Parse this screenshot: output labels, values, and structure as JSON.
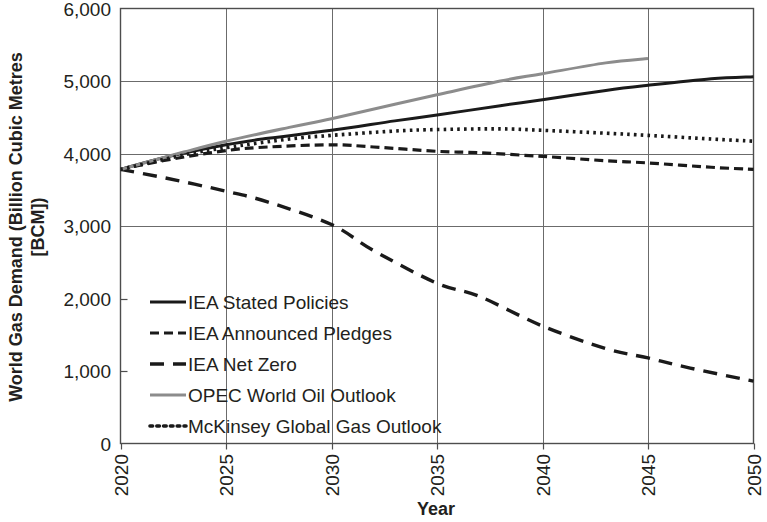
{
  "chart_data": {
    "type": "line",
    "title": "",
    "xlabel": "Year",
    "ylabel": "World Gas Demand (Billion Cubic Metres [BCM])",
    "ylabel_line1": "World Gas Demand (Billion Cubic Metres",
    "ylabel_line2": "[BCM])",
    "xlim": [
      2020,
      2050
    ],
    "ylim": [
      0,
      6000
    ],
    "x_ticks": [
      "2020",
      "2025",
      "2030",
      "2035",
      "2040",
      "2045",
      "2050"
    ],
    "x_tick_values": [
      2020,
      2025,
      2030,
      2035,
      2040,
      2045,
      2050
    ],
    "y_ticks": [
      "0",
      "1,000",
      "2,000",
      "3,000",
      "4,000",
      "5,000",
      "6,000"
    ],
    "y_tick_values": [
      0,
      1000,
      2000,
      3000,
      4000,
      5000,
      6000
    ],
    "grid": "horizontal-and-vertical",
    "legend_position": "inside-lower-left",
    "series": [
      {
        "name": "IEA Stated Policies",
        "style": "solid",
        "color": "#1a1a1a",
        "x": [
          2020,
          2022,
          2025,
          2027,
          2030,
          2033,
          2035,
          2038,
          2040,
          2043,
          2045,
          2048,
          2050
        ],
        "values": [
          3780,
          3940,
          4120,
          4210,
          4320,
          4450,
          4530,
          4660,
          4740,
          4870,
          4940,
          5030,
          5060
        ]
      },
      {
        "name": "IEA Announced Pledges",
        "style": "dashed-short",
        "color": "#1a1a1a",
        "x": [
          2020,
          2022,
          2025,
          2027,
          2030,
          2032,
          2035,
          2037,
          2040,
          2043,
          2045,
          2048,
          2050
        ],
        "values": [
          3780,
          3900,
          4040,
          4090,
          4120,
          4090,
          4030,
          4010,
          3960,
          3900,
          3870,
          3810,
          3780
        ]
      },
      {
        "name": "IEA Net Zero",
        "style": "dashed-long",
        "color": "#1a1a1a",
        "x": [
          2020,
          2022,
          2025,
          2027,
          2030,
          2032,
          2035,
          2037,
          2040,
          2043,
          2045,
          2047,
          2050
        ],
        "values": [
          3780,
          3670,
          3480,
          3330,
          3020,
          2660,
          2210,
          2030,
          1620,
          1310,
          1180,
          1040,
          860
        ]
      },
      {
        "name": "OPEC World Oil Outlook",
        "style": "solid",
        "color": "#8c8c8c",
        "x": [
          2020,
          2023,
          2025,
          2028,
          2030,
          2033,
          2035,
          2038,
          2040,
          2043,
          2045
        ],
        "values": [
          3780,
          4020,
          4170,
          4360,
          4480,
          4680,
          4810,
          5000,
          5100,
          5250,
          5310
        ]
      },
      {
        "name": "McKinsey Global Gas Outlook",
        "style": "dotted",
        "color": "#1a1a1a",
        "x": [
          2020,
          2023,
          2025,
          2028,
          2030,
          2033,
          2035,
          2038,
          2040,
          2043,
          2045,
          2048,
          2050
        ],
        "values": [
          3780,
          3980,
          4080,
          4200,
          4250,
          4310,
          4330,
          4340,
          4320,
          4280,
          4250,
          4200,
          4170
        ]
      }
    ]
  },
  "legend": {
    "items": [
      {
        "label": "IEA Stated Policies",
        "style": "solid",
        "color": "#1a1a1a"
      },
      {
        "label": "IEA Announced Pledges",
        "style": "dashed-short",
        "color": "#1a1a1a"
      },
      {
        "label": "IEA Net Zero",
        "style": "dashed-long",
        "color": "#1a1a1a"
      },
      {
        "label": "OPEC World Oil Outlook",
        "style": "solid",
        "color": "#8c8c8c"
      },
      {
        "label": "McKinsey Global Gas Outlook",
        "style": "dotted",
        "color": "#1a1a1a"
      }
    ]
  }
}
